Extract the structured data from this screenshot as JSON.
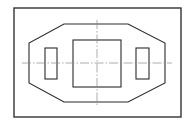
{
  "drawing": {
    "canvas": {
      "width": 191,
      "height": 125
    },
    "colors": {
      "background": "#ffffff",
      "outline": "#2b2b2b",
      "frame": "#333333",
      "centerline": "#8a8a8a"
    },
    "frame": {
      "x": 14,
      "y": 8,
      "width": 167,
      "height": 109
    },
    "octagon": {
      "points": [
        [
          64,
          24
        ],
        [
          128,
          24
        ],
        [
          165,
          43
        ],
        [
          165,
          83
        ],
        [
          128,
          102
        ],
        [
          64,
          102
        ],
        [
          29,
          83
        ],
        [
          29,
          43
        ]
      ]
    },
    "left_slot": {
      "x": 45,
      "y": 48,
      "width": 12,
      "height": 31
    },
    "center_square": {
      "x": 73,
      "y": 40,
      "width": 48,
      "height": 47
    },
    "right_slot": {
      "x": 136,
      "y": 48,
      "width": 13,
      "height": 31
    },
    "centerlines": {
      "horizontal": {
        "x1": 22,
        "y1": 63,
        "x2": 172,
        "y2": 63
      },
      "vertical": {
        "x1": 97,
        "y1": 20,
        "x2": 97,
        "y2": 107
      }
    }
  }
}
